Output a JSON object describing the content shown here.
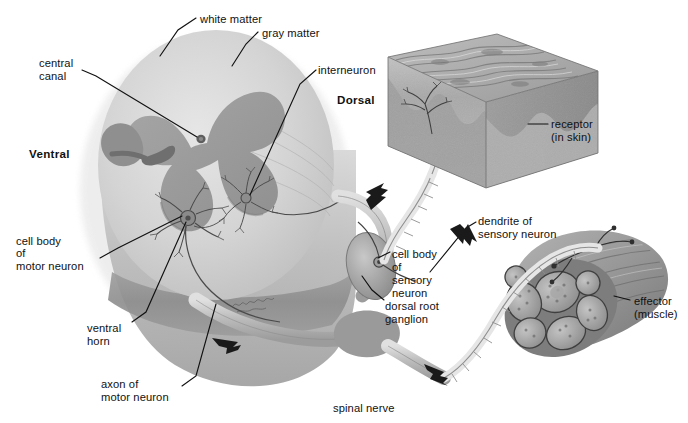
{
  "figure": {
    "type": "anatomical-diagram",
    "background_color": "#ffffff",
    "ink_color": "#111111"
  },
  "palette": {
    "white_matter": "#c9c9c9",
    "gray_matter": "#9a9a9a",
    "cord_shadow": "#8a8a8a",
    "nerve": "#b3b3b3",
    "skin_top": "#a8a8a8",
    "skin_side": "#bdbdbd",
    "muscle": "#9b9b9b",
    "muscle_fiber": "#b0b0b0",
    "leader_line": "#111111"
  },
  "labels": [
    {
      "key": "white_matter",
      "text": "white matter",
      "x": 200,
      "y": 13,
      "bold": false
    },
    {
      "key": "gray_matter",
      "text": "gray matter",
      "x": 262,
      "y": 27,
      "bold": false
    },
    {
      "key": "central_canal_1",
      "text": "central",
      "x": 39,
      "y": 57,
      "bold": false
    },
    {
      "key": "central_canal_2",
      "text": "canal",
      "x": 39,
      "y": 70,
      "bold": false
    },
    {
      "key": "interneuron",
      "text": "interneuron",
      "x": 318,
      "y": 64,
      "bold": false
    },
    {
      "key": "dorsal",
      "text": "Dorsal",
      "x": 337,
      "y": 94,
      "bold": true
    },
    {
      "key": "ventral",
      "text": "Ventral",
      "x": 29,
      "y": 148,
      "bold": true
    },
    {
      "key": "receptor_1",
      "text": "receptor",
      "x": 551,
      "y": 118,
      "bold": false
    },
    {
      "key": "receptor_2",
      "text": "(in skin)",
      "x": 551,
      "y": 131,
      "bold": false
    },
    {
      "key": "cellbody_motor_1",
      "text": "cell body",
      "x": 16,
      "y": 235,
      "bold": false
    },
    {
      "key": "cellbody_motor_2",
      "text": "of",
      "x": 16,
      "y": 247,
      "bold": false
    },
    {
      "key": "cellbody_motor_3",
      "text": "motor neuron",
      "x": 16,
      "y": 260,
      "bold": false
    },
    {
      "key": "ventral_horn_1",
      "text": "ventral",
      "x": 87,
      "y": 322,
      "bold": false
    },
    {
      "key": "ventral_horn_2",
      "text": "horn",
      "x": 87,
      "y": 335,
      "bold": false
    },
    {
      "key": "axon_motor_1",
      "text": "axon of",
      "x": 101,
      "y": 378,
      "bold": false
    },
    {
      "key": "axon_motor_2",
      "text": "motor neuron",
      "x": 101,
      "y": 391,
      "bold": false
    },
    {
      "key": "dendrite_1",
      "text": "dendrite of",
      "x": 478,
      "y": 215,
      "bold": false
    },
    {
      "key": "dendrite_2",
      "text": "sensory neuron",
      "x": 478,
      "y": 228,
      "bold": false
    },
    {
      "key": "cellbody_sens_1",
      "text": "cell body",
      "x": 392,
      "y": 248,
      "bold": false
    },
    {
      "key": "cellbody_sens_2",
      "text": "of",
      "x": 392,
      "y": 261,
      "bold": false
    },
    {
      "key": "cellbody_sens_3",
      "text": "sensory",
      "x": 392,
      "y": 274,
      "bold": false
    },
    {
      "key": "cellbody_sens_4",
      "text": "neuron",
      "x": 392,
      "y": 287,
      "bold": false
    },
    {
      "key": "drg_1",
      "text": "dorsal root",
      "x": 385,
      "y": 300,
      "bold": false
    },
    {
      "key": "drg_2",
      "text": "ganglion",
      "x": 385,
      "y": 313,
      "bold": false
    },
    {
      "key": "effector_1",
      "text": "effector",
      "x": 634,
      "y": 295,
      "bold": false
    },
    {
      "key": "effector_2",
      "text": "(muscle)",
      "x": 634,
      "y": 308,
      "bold": false
    },
    {
      "key": "spinal_nerve",
      "text": "spinal nerve",
      "x": 333,
      "y": 402,
      "bold": false
    }
  ],
  "structures": [
    {
      "key": "spinal-cord",
      "name": "spinal cord cross-section"
    },
    {
      "key": "white-matter",
      "name": "white matter"
    },
    {
      "key": "gray-matter",
      "name": "gray matter"
    },
    {
      "key": "central-canal",
      "name": "central canal"
    },
    {
      "key": "ventral-horn",
      "name": "ventral horn"
    },
    {
      "key": "interneuron",
      "name": "interneuron"
    },
    {
      "key": "motor-neuron-cell-body",
      "name": "cell body of motor neuron"
    },
    {
      "key": "motor-axon",
      "name": "axon of motor neuron"
    },
    {
      "key": "dorsal-root",
      "name": "dorsal root"
    },
    {
      "key": "dorsal-root-ganglion",
      "name": "dorsal root ganglion"
    },
    {
      "key": "sensory-dendrite",
      "name": "dendrite of sensory neuron"
    },
    {
      "key": "spinal-nerve",
      "name": "spinal nerve"
    },
    {
      "key": "skin-block",
      "name": "skin block with receptor"
    },
    {
      "key": "muscle",
      "name": "effector muscle"
    }
  ]
}
